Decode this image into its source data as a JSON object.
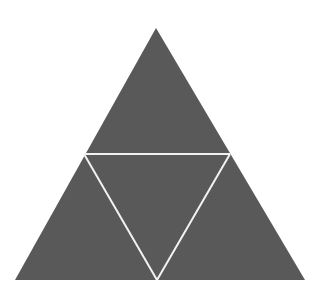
{
  "diagram": {
    "type": "sierpinski-triangle-level-1",
    "background": "#ffffff",
    "fill_color": "#595959",
    "line_color": "#f2f2f2",
    "outer_triangle": {
      "apex": [
        156,
        28
      ],
      "bottom_left": [
        15,
        280
      ],
      "bottom_right": [
        305,
        280
      ]
    },
    "midpoints": {
      "left": [
        84,
        154
      ],
      "right": [
        230,
        154
      ],
      "bottom": [
        157,
        280
      ]
    },
    "sub_triangles": [
      {
        "name": "top",
        "points": [
          [
            156,
            28
          ],
          [
            84,
            154
          ],
          [
            230,
            154
          ]
        ]
      },
      {
        "name": "bottom-left",
        "points": [
          [
            84,
            154
          ],
          [
            15,
            280
          ],
          [
            157,
            280
          ]
        ]
      },
      {
        "name": "bottom-right",
        "points": [
          [
            230,
            154
          ],
          [
            157,
            280
          ],
          [
            305,
            280
          ]
        ]
      },
      {
        "name": "center-inverted",
        "points": [
          [
            84,
            154
          ],
          [
            230,
            154
          ],
          [
            157,
            280
          ]
        ]
      }
    ]
  }
}
